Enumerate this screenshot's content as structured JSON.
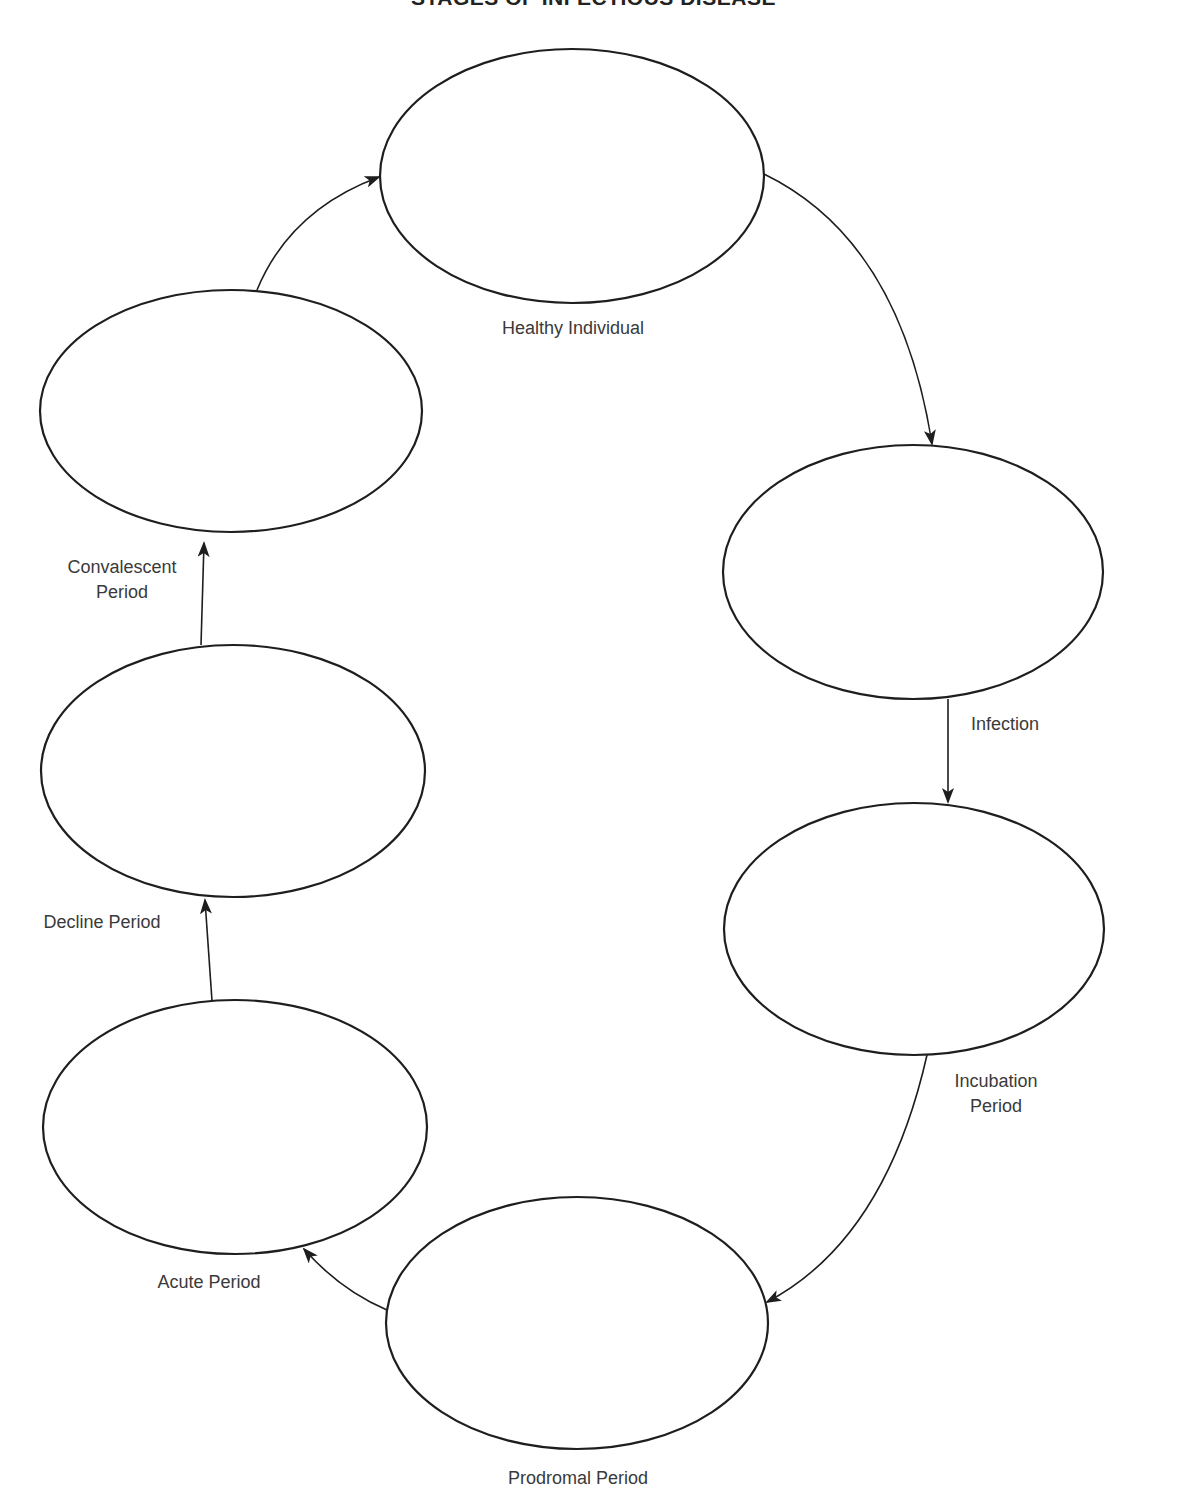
{
  "title": "STAGES OF INFECTIOUS DISEASE",
  "colors": {
    "stroke": "#1e1e1e",
    "text": "#3a3a3a",
    "background": "#ffffff"
  },
  "stages": [
    {
      "id": "healthy",
      "label_lines": [
        "Healthy Individual"
      ],
      "cx": 572,
      "cy": 176,
      "rx": 192,
      "ry": 127
    },
    {
      "id": "infection",
      "label_lines": [
        "Infection"
      ],
      "cx": 913,
      "cy": 572,
      "rx": 190,
      "ry": 127
    },
    {
      "id": "incubation",
      "label_lines": [
        "Incubation",
        "Period"
      ],
      "cx": 914,
      "cy": 929,
      "rx": 190,
      "ry": 126
    },
    {
      "id": "prodromal",
      "label_lines": [
        "Prodromal Period"
      ],
      "cx": 577,
      "cy": 1323,
      "rx": 191,
      "ry": 126
    },
    {
      "id": "acute",
      "label_lines": [
        "Acute Period"
      ],
      "cx": 235,
      "cy": 1127,
      "rx": 192,
      "ry": 127
    },
    {
      "id": "decline",
      "label_lines": [
        "Decline Period"
      ],
      "cx": 233,
      "cy": 771,
      "rx": 192,
      "ry": 126
    },
    {
      "id": "convalescent",
      "label_lines": [
        "Convalescent",
        "Period"
      ],
      "cx": 231,
      "cy": 411,
      "rx": 191,
      "ry": 121
    }
  ],
  "cycle_order": [
    "Healthy Individual",
    "Infection",
    "Incubation Period",
    "Prodromal Period",
    "Acute Period",
    "Decline Period",
    "Convalescent Period",
    "Healthy Individual"
  ]
}
